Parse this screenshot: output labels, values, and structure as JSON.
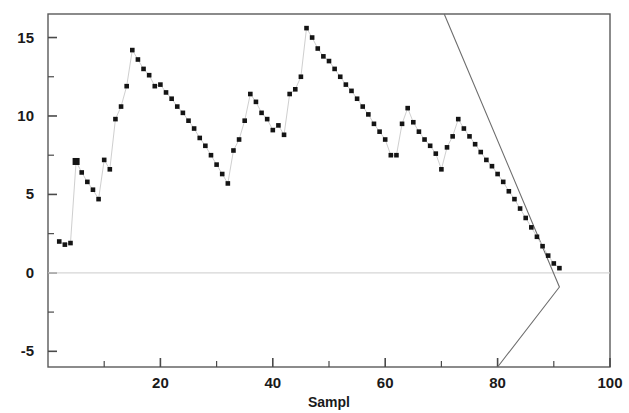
{
  "chart_data": {
    "type": "scatter",
    "title": "",
    "xlabel": "Sampl",
    "ylabel": "",
    "xlim": [
      0,
      100
    ],
    "ylim": [
      -6.0,
      16.5
    ],
    "grid": false,
    "legend": false,
    "x_ticks": [
      20,
      40,
      60,
      80,
      100
    ],
    "x_tick_labels": [
      "20",
      "40",
      "60",
      "80",
      "100"
    ],
    "x_minor_ticks": [
      10,
      30,
      50,
      70,
      90
    ],
    "y_ticks": [
      -5,
      0,
      5,
      10,
      15
    ],
    "y_tick_labels": [
      "-5",
      "0",
      "5",
      "10",
      "15"
    ],
    "y_minor_ticks": [
      -2.5,
      2.5,
      7.5,
      12.5
    ],
    "reference_line_y": 0,
    "marker": "filled-square",
    "marker_color": "#141414",
    "connector_color": "#cfcfcf",
    "limit_line_color": "#6e6e6e",
    "series": [
      {
        "name": "sample-statistic",
        "x": [
          2,
          3,
          4,
          5,
          6,
          7,
          8,
          9,
          10,
          11,
          12,
          13,
          14,
          15,
          16,
          17,
          18,
          19,
          20,
          21,
          22,
          23,
          24,
          25,
          26,
          27,
          28,
          29,
          30,
          31,
          32,
          33,
          34,
          35,
          36,
          37,
          38,
          39,
          40,
          41,
          42,
          43,
          44,
          45,
          46,
          47,
          48,
          49,
          50,
          51,
          52,
          53,
          54,
          55,
          56,
          57,
          58,
          59,
          60,
          61,
          62,
          63,
          64,
          65,
          66,
          67,
          68,
          69,
          70,
          71,
          72,
          73,
          74,
          75,
          76,
          77,
          78,
          79,
          80,
          81,
          82,
          83,
          84,
          85,
          86,
          87,
          88,
          89,
          90,
          91
        ],
        "y": [
          2.0,
          1.8,
          1.9,
          7.1,
          6.4,
          5.8,
          5.3,
          4.7,
          7.2,
          6.6,
          9.8,
          10.6,
          11.9,
          14.2,
          13.6,
          13.0,
          12.6,
          11.9,
          12.0,
          11.5,
          11.1,
          10.6,
          10.2,
          9.7,
          9.2,
          8.6,
          8.1,
          7.5,
          6.9,
          6.3,
          5.7,
          7.8,
          8.5,
          9.7,
          11.4,
          10.9,
          10.2,
          9.8,
          9.1,
          9.4,
          8.8,
          11.4,
          11.7,
          12.5,
          15.6,
          15.0,
          14.3,
          13.8,
          13.5,
          13.0,
          12.5,
          12.0,
          11.6,
          11.1,
          10.6,
          10.1,
          9.5,
          9.0,
          8.5,
          7.5,
          7.5,
          9.5,
          10.5,
          9.6,
          9.0,
          8.5,
          8.1,
          7.6,
          6.6,
          8.0,
          8.7,
          9.8,
          9.2,
          8.7,
          8.2,
          7.7,
          7.2,
          6.8,
          6.3,
          5.8,
          5.2,
          4.7,
          4.1,
          3.5,
          2.9,
          2.3,
          1.7,
          1.1,
          0.6,
          0.3
        ],
        "highlighted_points": [
          {
            "x": 5,
            "y": 7.1
          }
        ]
      }
    ],
    "limit_line": {
      "name": "control-limit",
      "x": [
        70.5,
        91.0,
        80.0
      ],
      "y": [
        16.5,
        -0.9,
        -6.0
      ]
    }
  },
  "axis": {
    "x_title": "Sampl"
  }
}
